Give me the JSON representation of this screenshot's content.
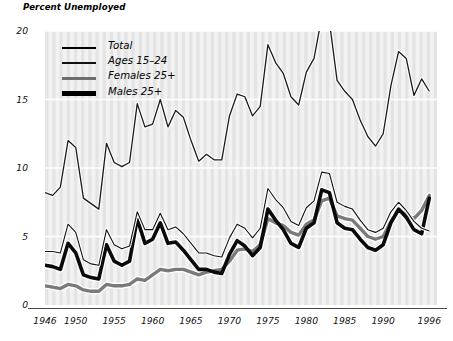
{
  "chart_data": {
    "type": "line",
    "title": "Percent Unemployed",
    "xlabel": "",
    "ylabel": "Percent Unemployed",
    "xlim": [
      1946,
      1997
    ],
    "ylim": [
      0,
      20
    ],
    "grid": true,
    "grid_style": "white horizontal gridlines and vertical bands on light gray striped background",
    "legend_position": "top-left inside plot",
    "ytick_labels": [
      "0",
      "5",
      "10",
      "15",
      "20"
    ],
    "ytick_values": [
      0,
      5,
      10,
      15,
      20
    ],
    "xtick_labels": [
      "1946",
      "1950",
      "1955",
      "1960",
      "1965",
      "1970",
      "1975",
      "1980",
      "1985",
      "1990",
      "1996"
    ],
    "xtick_values": [
      1946,
      1950,
      1955,
      1960,
      1965,
      1970,
      1975,
      1980,
      1985,
      1990,
      1996
    ],
    "x": [
      1946,
      1947,
      1948,
      1949,
      1950,
      1951,
      1952,
      1953,
      1954,
      1955,
      1956,
      1957,
      1958,
      1959,
      1960,
      1961,
      1962,
      1963,
      1964,
      1965,
      1966,
      1967,
      1968,
      1969,
      1970,
      1971,
      1972,
      1973,
      1974,
      1975,
      1976,
      1977,
      1978,
      1979,
      1980,
      1981,
      1982,
      1983,
      1984,
      1985,
      1986,
      1987,
      1988,
      1989,
      1990,
      1991,
      1992,
      1993,
      1994,
      1995,
      1996
    ],
    "series": [
      {
        "name": "Total",
        "style": "thin black line",
        "color": "#111111",
        "width": 1.1,
        "values": [
          3.9,
          3.9,
          3.8,
          5.9,
          5.3,
          3.3,
          3.0,
          2.9,
          5.5,
          4.4,
          4.1,
          4.3,
          6.8,
          5.5,
          5.5,
          6.7,
          5.5,
          5.7,
          5.2,
          4.5,
          3.8,
          3.8,
          3.6,
          3.5,
          4.9,
          5.9,
          5.6,
          4.9,
          5.6,
          8.5,
          7.7,
          7.1,
          6.1,
          5.8,
          7.1,
          7.6,
          9.7,
          9.6,
          7.5,
          7.2,
          7.0,
          6.2,
          5.5,
          5.3,
          5.6,
          6.8,
          7.5,
          6.9,
          6.1,
          5.6,
          5.4
        ]
      },
      {
        "name": "Ages 15–24",
        "style": "medium black line",
        "color": "#1a1a1a",
        "width": 1.3,
        "values": [
          8.2,
          8.0,
          8.6,
          12.0,
          11.5,
          7.8,
          7.4,
          7.0,
          11.8,
          10.4,
          10.1,
          10.4,
          14.7,
          13.0,
          13.2,
          15.0,
          13.0,
          14.2,
          13.7,
          12.0,
          10.5,
          11.0,
          10.6,
          10.6,
          13.8,
          15.4,
          15.2,
          13.8,
          14.5,
          19.0,
          17.7,
          16.9,
          15.2,
          14.6,
          17.0,
          18.0,
          21.0,
          20.7,
          16.4,
          15.6,
          15.0,
          13.5,
          12.3,
          11.6,
          12.5,
          16.0,
          18.5,
          18.0,
          15.3,
          16.5,
          15.6
        ]
      },
      {
        "name": "Females 25+",
        "style": "medium gray line with white halo",
        "color": "#7a7a7a",
        "width": 3.4,
        "values": [
          1.4,
          1.3,
          1.2,
          1.5,
          1.4,
          1.1,
          1.0,
          1.0,
          1.5,
          1.4,
          1.4,
          1.5,
          1.9,
          1.8,
          2.2,
          2.6,
          2.5,
          2.6,
          2.6,
          2.4,
          2.2,
          2.4,
          2.5,
          2.6,
          3.2,
          4.0,
          4.1,
          3.9,
          4.4,
          6.3,
          6.0,
          5.8,
          5.3,
          5.1,
          5.9,
          6.2,
          7.6,
          7.8,
          6.5,
          6.3,
          6.2,
          5.6,
          5.0,
          4.8,
          5.0,
          6.1,
          6.9,
          6.6,
          6.3,
          6.9,
          8.0
        ]
      },
      {
        "name": "Males 25+",
        "style": "thick black line with white halo",
        "color": "#0a0a0a",
        "width": 3.6,
        "values": [
          2.9,
          2.8,
          2.6,
          4.5,
          3.8,
          2.2,
          2.0,
          1.9,
          4.4,
          3.2,
          2.9,
          3.2,
          6.3,
          4.5,
          4.8,
          6.0,
          4.5,
          4.6,
          4.0,
          3.3,
          2.6,
          2.6,
          2.4,
          2.3,
          3.7,
          4.7,
          4.3,
          3.6,
          4.2,
          7.0,
          6.2,
          5.5,
          4.5,
          4.2,
          5.6,
          6.0,
          8.4,
          8.2,
          6.0,
          5.6,
          5.5,
          4.8,
          4.2,
          4.0,
          4.4,
          6.0,
          7.0,
          6.4,
          5.5,
          5.2,
          7.8
        ]
      }
    ]
  },
  "axis_title": "Percent Unemployed",
  "legend": {
    "items": [
      {
        "label": "Total"
      },
      {
        "label": "Ages 15–24"
      },
      {
        "label": "Females 25+"
      },
      {
        "label": "Males 25+"
      }
    ]
  },
  "colors": {
    "plot_background": "#f2f2f2",
    "stripe": "#e4e4e4",
    "gridline": "#ffffff",
    "axis": "#4a4a4a",
    "text": "#111111"
  }
}
